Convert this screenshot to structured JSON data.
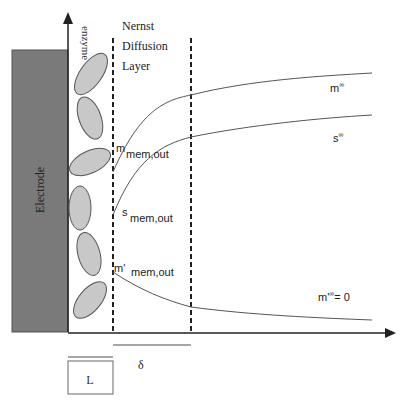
{
  "diagram": {
    "electrode_label": "Electrode",
    "enzyme_label": "enzyme",
    "nernst_title": [
      "Nernst",
      "Diffusion",
      "Layer"
    ],
    "curves": {
      "m_inf": {
        "label": "m",
        "sup": "∞"
      },
      "s_inf": {
        "label": "s",
        "sup": "∞"
      },
      "mprime_inf": {
        "label": "m'",
        "sup": "∞",
        "suffix": "= 0"
      }
    },
    "boundary_labels": {
      "m_mem_out": {
        "main": "m",
        "sub": "mem,out"
      },
      "s_mem_out": {
        "main": "s",
        "sub": "mem,out"
      },
      "mprime_mem_out": {
        "main": "m'",
        "sub": "mem,out"
      }
    },
    "delta_label": "δ",
    "L_label": "L",
    "colors": {
      "electrode": "#7a7a7a",
      "enzyme_fill": "#c8c8c8",
      "line": "#333333",
      "curve": "#555555"
    }
  }
}
